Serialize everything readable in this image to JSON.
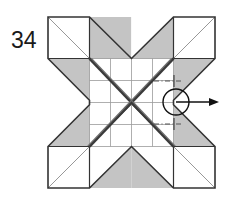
{
  "figure": {
    "label": "34",
    "caption": "",
    "type": "origami-crease-pattern-step"
  },
  "canvas": {
    "width": 229,
    "height": 205,
    "background": "#ffffff"
  },
  "colors": {
    "outline": "#333333",
    "fold_line": "#4a4a4a",
    "grid_line": "#9a9a9a",
    "thin_diagonal": "#8c8c8c",
    "shaded_fill": "#c4c4c4",
    "white_fill": "#ffffff",
    "arrow": "#111111",
    "dashdot": "#555555",
    "label_text": "#1a1a1a"
  },
  "geometry": {
    "outer_left": 48,
    "outer_right": 215,
    "outer_top": 17,
    "outer_bottom": 188,
    "cell": 41.75,
    "grid_left": 89.5,
    "grid_right": 173.5,
    "grid_top": 58.5,
    "grid_bottom": 146.5,
    "center_x": 131.5,
    "center_y": 102.5,
    "grid_divisions": 4
  },
  "annotations": {
    "circle": {
      "name": "rotation-marker",
      "cx": 176,
      "cy": 102,
      "r": 13,
      "stroke": "#111111",
      "stroke_width": 1.4,
      "fill": "none"
    },
    "arrow": {
      "name": "pull-direction-arrow",
      "x1": 176,
      "y1": 102,
      "x2": 218,
      "y2": 102,
      "direction": "right",
      "head_length": 8,
      "head_width": 5
    },
    "dashdot_lines": [
      {
        "name": "upper-guide",
        "x1": 154,
        "y1": 81,
        "x2": 180,
        "y2": 81
      },
      {
        "name": "lower-guide",
        "x1": 154,
        "y1": 124,
        "x2": 180,
        "y2": 124
      }
    ]
  },
  "shaded_regions": [
    {
      "name": "top-left-inner-triangle",
      "points": "89.5,17 131.5,17 131.5,58.5"
    },
    {
      "name": "top-right-inner-triangle",
      "points": "131.5,17 173.5,17 131.5,58.5"
    },
    {
      "name": "left-upper-wing",
      "points": "48,58.5 89.5,58.5 89.5,100.25"
    },
    {
      "name": "right-upper-wing",
      "points": "173.5,58.5 215,58.5 173.5,100.25"
    },
    {
      "name": "left-lower-wing",
      "points": "48,146.5 89.5,146.5 89.5,104.75"
    },
    {
      "name": "right-lower-wing",
      "points": "173.5,146.5 215,146.5 173.5,104.75"
    },
    {
      "name": "bottom-left-inner-triangle",
      "points": "89.5,188 131.5,188 131.5,146.5"
    },
    {
      "name": "bottom-right-inner-triangle",
      "points": "131.5,188 173.5,188 131.5,146.5"
    }
  ],
  "white_regions": [
    {
      "name": "top-left-square",
      "points": "48,17 89.5,17 89.5,58.5 48,58.5"
    },
    {
      "name": "top-right-square",
      "points": "173.5,17 215,17 215,58.5 173.5,58.5"
    },
    {
      "name": "bottom-left-square",
      "points": "48,146.5 89.5,146.5 89.5,188 48,188"
    },
    {
      "name": "bottom-right-square",
      "points": "173.5,146.5 215,146.5 215,188 173.5,188"
    },
    {
      "name": "center-grid-panel",
      "points": "89.5,58.5 173.5,58.5 173.5,146.5 89.5,146.5"
    }
  ],
  "outline_path": {
    "name": "star-outline",
    "points": "48,17 89.5,17 131.5,58.5 173.5,17 215,17 215,58.5 173.5,100.25 173.5,104.75 215,146.5 215,188 173.5,188 131.5,146.5 89.5,188 48,188 48,146.5 89.5,104.75 89.5,100.25 48,58.5"
  },
  "thin_corner_diagonals": [
    {
      "name": "tl-corner-diagonal",
      "x1": 48,
      "y1": 17,
      "x2": 131.5,
      "y2": 100.5
    },
    {
      "name": "tr-corner-diagonal",
      "x1": 215,
      "y1": 17,
      "x2": 131.5,
      "y2": 100.5
    },
    {
      "name": "bl-corner-diagonal",
      "x1": 48,
      "y1": 188,
      "x2": 131.5,
      "y2": 104.5
    },
    {
      "name": "br-corner-diagonal",
      "x1": 215,
      "y1": 188,
      "x2": 131.5,
      "y2": 104.5
    }
  ],
  "grid_lines": {
    "vertical": [
      89.5,
      110.5,
      131.5,
      152.5,
      173.5
    ],
    "horizontal": [
      58.5,
      80.5,
      102.5,
      124.5,
      146.5
    ]
  },
  "fold_diagonals": [
    {
      "name": "major-fold-nw-se",
      "x1": 89.5,
      "y1": 58.5,
      "x2": 173.5,
      "y2": 146.5
    },
    {
      "name": "major-fold-ne-sw",
      "x1": 173.5,
      "y1": 58.5,
      "x2": 89.5,
      "y2": 146.5
    }
  ]
}
